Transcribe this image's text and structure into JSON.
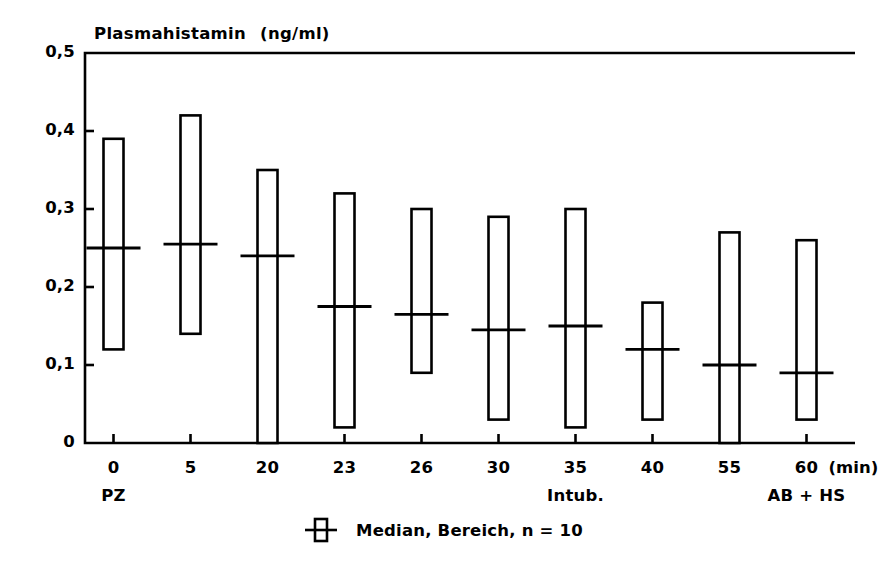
{
  "chart_data": {
    "type": "bar",
    "title": "Plasmahistamin",
    "title_units": "(ng/ml)",
    "xlabel": "",
    "xlabel_unit": "(min)",
    "ylabel": "",
    "ylim": [
      0,
      0.5
    ],
    "xlim": [
      -0.5,
      9.5
    ],
    "grid": false,
    "legend_position": "bottom-center",
    "legend_label": "Median, Bereich,  n = 10",
    "y_ticks": [
      "0",
      "0,1",
      "0,2",
      "0,3",
      "0,4",
      "0,5"
    ],
    "y_tick_values": [
      0,
      0.1,
      0.2,
      0.3,
      0.4,
      0.5
    ],
    "categories": [
      "0",
      "5",
      "20",
      "23",
      "26",
      "30",
      "35",
      "40",
      "55",
      "60"
    ],
    "category_sublabels": {
      "0": "PZ",
      "35": "Intub.",
      "60": "AB + HS"
    },
    "series": [
      {
        "name": "Minimum",
        "values": [
          0.12,
          0.14,
          0.0,
          0.02,
          0.09,
          0.03,
          0.02,
          0.03,
          0.0,
          0.03
        ]
      },
      {
        "name": "Maximum",
        "values": [
          0.39,
          0.42,
          0.35,
          0.32,
          0.3,
          0.29,
          0.3,
          0.18,
          0.27,
          0.26
        ]
      },
      {
        "name": "Median",
        "values": [
          0.25,
          0.255,
          0.24,
          0.175,
          0.165,
          0.145,
          0.15,
          0.12,
          0.1,
          0.09
        ]
      }
    ],
    "points": [
      {
        "x": "0",
        "sublabel": "PZ",
        "min": 0.12,
        "max": 0.39,
        "median": 0.25
      },
      {
        "x": "5",
        "sublabel": "",
        "min": 0.14,
        "max": 0.42,
        "median": 0.255
      },
      {
        "x": "20",
        "sublabel": "",
        "min": 0.0,
        "max": 0.35,
        "median": 0.24
      },
      {
        "x": "23",
        "sublabel": "",
        "min": 0.02,
        "max": 0.32,
        "median": 0.175
      },
      {
        "x": "26",
        "sublabel": "",
        "min": 0.09,
        "max": 0.3,
        "median": 0.165
      },
      {
        "x": "30",
        "sublabel": "",
        "min": 0.03,
        "max": 0.29,
        "median": 0.145
      },
      {
        "x": "35",
        "sublabel": "Intub.",
        "min": 0.02,
        "max": 0.3,
        "median": 0.15
      },
      {
        "x": "40",
        "sublabel": "",
        "min": 0.03,
        "max": 0.18,
        "median": 0.12
      },
      {
        "x": "55",
        "sublabel": "",
        "min": 0.0,
        "max": 0.27,
        "median": 0.1
      },
      {
        "x": "60",
        "sublabel": "AB + HS",
        "min": 0.03,
        "max": 0.26,
        "median": 0.09
      }
    ],
    "colors": {
      "axis": "#000000",
      "bar_stroke": "#000000",
      "bar_fill": "#ffffff",
      "median_line": "#000000",
      "background": "#ffffff"
    }
  }
}
